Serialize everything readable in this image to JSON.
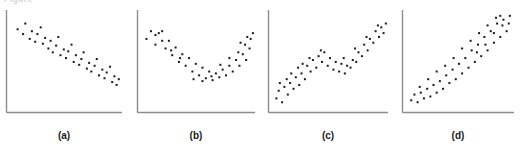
{
  "figure": {
    "clipped_header_text": "Figure",
    "axis_color": "#8c8c8c",
    "marker_color": "#1a1a1a",
    "background_color": "#ffffff",
    "caption_color": "#1a1a1a"
  },
  "chart_data": [
    {
      "type": "scatter",
      "title": "",
      "caption": "(a)",
      "xlabel": "",
      "ylabel": "",
      "grid": false,
      "legend": "none",
      "xlim": [
        0,
        100
      ],
      "ylim": [
        0,
        100
      ],
      "pattern": "decreasing-linear",
      "marker": "square",
      "marker_size_px": 2,
      "points": [
        [
          6,
          82
        ],
        [
          11,
          77
        ],
        [
          13,
          88
        ],
        [
          17,
          72
        ],
        [
          19,
          80
        ],
        [
          22,
          69
        ],
        [
          24,
          77
        ],
        [
          27,
          84
        ],
        [
          29,
          67
        ],
        [
          31,
          73
        ],
        [
          34,
          62
        ],
        [
          36,
          70
        ],
        [
          38,
          58
        ],
        [
          41,
          65
        ],
        [
          43,
          74
        ],
        [
          45,
          55
        ],
        [
          48,
          61
        ],
        [
          50,
          52
        ],
        [
          52,
          59
        ],
        [
          55,
          66
        ],
        [
          57,
          48
        ],
        [
          59,
          55
        ],
        [
          62,
          45
        ],
        [
          64,
          51
        ],
        [
          66,
          58
        ],
        [
          69,
          41
        ],
        [
          71,
          47
        ],
        [
          73,
          38
        ],
        [
          76,
          44
        ],
        [
          78,
          51
        ],
        [
          80,
          34
        ],
        [
          83,
          40
        ],
        [
          85,
          31
        ],
        [
          87,
          37
        ],
        [
          90,
          43
        ],
        [
          92,
          27
        ],
        [
          94,
          33
        ],
        [
          96,
          24
        ],
        [
          98,
          30
        ]
      ]
    },
    {
      "type": "scatter",
      "title": "",
      "caption": "(b)",
      "xlabel": "",
      "ylabel": "",
      "grid": false,
      "legend": "none",
      "xlim": [
        0,
        100
      ],
      "ylim": [
        0,
        100
      ],
      "pattern": "u-shaped-quadratic",
      "marker": "square",
      "marker_size_px": 2,
      "points": [
        [
          4,
          72
        ],
        [
          8,
          80
        ],
        [
          12,
          66
        ],
        [
          15,
          78
        ],
        [
          18,
          80
        ],
        [
          21,
          62
        ],
        [
          24,
          70
        ],
        [
          27,
          55
        ],
        [
          30,
          63
        ],
        [
          33,
          48
        ],
        [
          36,
          56
        ],
        [
          39,
          44
        ],
        [
          42,
          52
        ],
        [
          45,
          38
        ],
        [
          48,
          46
        ],
        [
          51,
          34
        ],
        [
          54,
          42
        ],
        [
          57,
          31
        ],
        [
          60,
          38
        ],
        [
          63,
          29
        ],
        [
          66,
          36
        ],
        [
          69,
          32
        ],
        [
          72,
          40
        ],
        [
          75,
          34
        ],
        [
          78,
          44
        ],
        [
          81,
          38
        ],
        [
          84,
          50
        ],
        [
          87,
          44
        ],
        [
          90,
          56
        ],
        [
          93,
          50
        ],
        [
          96,
          62
        ],
        [
          46,
          30
        ],
        [
          54,
          28
        ],
        [
          62,
          33
        ],
        [
          70,
          45
        ],
        [
          78,
          52
        ],
        [
          86,
          58
        ],
        [
          92,
          66
        ],
        [
          97,
          72
        ],
        [
          99,
          78
        ],
        [
          18,
          70
        ],
        [
          26,
          60
        ],
        [
          34,
          52
        ],
        [
          12,
          76
        ],
        [
          88,
          68
        ],
        [
          94,
          74
        ]
      ]
    },
    {
      "type": "scatter",
      "title": "",
      "caption": "(c)",
      "xlabel": "",
      "ylabel": "",
      "grid": false,
      "legend": "none",
      "xlim": [
        0,
        100
      ],
      "ylim": [
        0,
        100
      ],
      "pattern": "s-shaped-cubic",
      "marker": "square",
      "marker_size_px": 2,
      "points": [
        [
          3,
          10
        ],
        [
          5,
          18
        ],
        [
          8,
          6
        ],
        [
          10,
          22
        ],
        [
          13,
          14
        ],
        [
          15,
          26
        ],
        [
          18,
          20
        ],
        [
          20,
          32
        ],
        [
          23,
          24
        ],
        [
          25,
          36
        ],
        [
          28,
          30
        ],
        [
          30,
          44
        ],
        [
          33,
          38
        ],
        [
          35,
          50
        ],
        [
          38,
          42
        ],
        [
          40,
          54
        ],
        [
          43,
          48
        ],
        [
          45,
          58
        ],
        [
          48,
          44
        ],
        [
          50,
          52
        ],
        [
          53,
          40
        ],
        [
          55,
          48
        ],
        [
          58,
          38
        ],
        [
          60,
          46
        ],
        [
          63,
          36
        ],
        [
          65,
          44
        ],
        [
          68,
          42
        ],
        [
          70,
          50
        ],
        [
          73,
          48
        ],
        [
          75,
          58
        ],
        [
          78,
          54
        ],
        [
          80,
          66
        ],
        [
          83,
          60
        ],
        [
          85,
          72
        ],
        [
          88,
          68
        ],
        [
          90,
          80
        ],
        [
          93,
          74
        ],
        [
          95,
          84
        ],
        [
          97,
          78
        ],
        [
          99,
          88
        ],
        [
          12,
          30
        ],
        [
          22,
          42
        ],
        [
          32,
          52
        ],
        [
          42,
          60
        ],
        [
          6,
          26
        ],
        [
          16,
          36
        ],
        [
          26,
          46
        ],
        [
          62,
          52
        ],
        [
          72,
          62
        ],
        [
          82,
          74
        ],
        [
          92,
          86
        ]
      ]
    },
    {
      "type": "scatter",
      "title": "",
      "caption": "(d)",
      "xlabel": "",
      "ylabel": "",
      "grid": false,
      "legend": "none",
      "xlim": [
        0,
        100
      ],
      "ylim": [
        0,
        100
      ],
      "pattern": "increasing-fanning-variance",
      "marker": "square",
      "marker_size_px": 2,
      "points": [
        [
          4,
          8
        ],
        [
          7,
          14
        ],
        [
          10,
          6
        ],
        [
          13,
          16
        ],
        [
          16,
          10
        ],
        [
          19,
          20
        ],
        [
          22,
          12
        ],
        [
          25,
          24
        ],
        [
          28,
          16
        ],
        [
          31,
          28
        ],
        [
          34,
          20
        ],
        [
          37,
          34
        ],
        [
          40,
          26
        ],
        [
          43,
          40
        ],
        [
          46,
          30
        ],
        [
          49,
          46
        ],
        [
          52,
          36
        ],
        [
          55,
          52
        ],
        [
          58,
          42
        ],
        [
          61,
          60
        ],
        [
          64,
          48
        ],
        [
          67,
          66
        ],
        [
          70,
          54
        ],
        [
          73,
          74
        ],
        [
          76,
          60
        ],
        [
          79,
          80
        ],
        [
          82,
          68
        ],
        [
          85,
          88
        ],
        [
          88,
          74
        ],
        [
          91,
          92
        ],
        [
          94,
          80
        ],
        [
          97,
          96
        ],
        [
          12,
          22
        ],
        [
          20,
          30
        ],
        [
          28,
          38
        ],
        [
          36,
          44
        ],
        [
          44,
          52
        ],
        [
          52,
          62
        ],
        [
          60,
          70
        ],
        [
          68,
          78
        ],
        [
          76,
          86
        ],
        [
          84,
          94
        ],
        [
          66,
          58
        ],
        [
          74,
          66
        ],
        [
          82,
          78
        ],
        [
          90,
          86
        ],
        [
          96,
          88
        ],
        [
          88,
          96
        ]
      ]
    }
  ]
}
